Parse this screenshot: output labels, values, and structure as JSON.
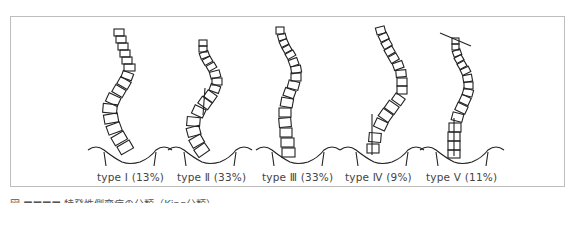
{
  "figure": {
    "types": [
      {
        "label": "type Ⅰ (13%)",
        "name": "type-1"
      },
      {
        "label": "type Ⅱ (33%)",
        "name": "type-2"
      },
      {
        "label": "type Ⅲ (33%)",
        "name": "type-3"
      },
      {
        "label": "type Ⅳ (9%)",
        "name": "type-4"
      },
      {
        "label": "type Ⅴ (11%)",
        "name": "type-5"
      }
    ],
    "caption": "図 ■■■■  特発性側弯症の分類（King分類）"
  }
}
